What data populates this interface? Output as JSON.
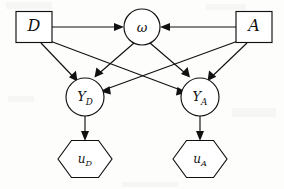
{
  "diagram": {
    "type": "influence-diagram",
    "background_color": "#fdfdfc",
    "line_color": "#111111",
    "node_fill_color": "#ffffff",
    "width": 284,
    "height": 189,
    "nodes": [
      {
        "id": "D",
        "label": "D",
        "shape": "square",
        "role": "decision",
        "cx": 34,
        "cy": 27,
        "w": 36,
        "h": 31
      },
      {
        "id": "A",
        "label": "A",
        "shape": "square",
        "role": "decision",
        "cx": 254,
        "cy": 27,
        "w": 36,
        "h": 31
      },
      {
        "id": "w",
        "label": "ω",
        "shape": "circle",
        "role": "chance",
        "cx": 142,
        "cy": 27,
        "r": 18
      },
      {
        "id": "YD",
        "label": "Y",
        "sub": "D",
        "shape": "circle",
        "role": "chance",
        "cx": 85,
        "cy": 97,
        "r": 19
      },
      {
        "id": "YA",
        "label": "Y",
        "sub": "A",
        "shape": "circle",
        "role": "chance",
        "cx": 200,
        "cy": 97,
        "r": 19
      },
      {
        "id": "uD",
        "label": "u",
        "sub": "D",
        "shape": "hexagon",
        "role": "utility",
        "cx": 85,
        "cy": 159,
        "w": 55,
        "h": 38
      },
      {
        "id": "uA",
        "label": "u",
        "sub": "A",
        "shape": "hexagon",
        "role": "utility",
        "cx": 200,
        "cy": 159,
        "w": 55,
        "h": 38
      }
    ],
    "edges": [
      {
        "from": "D",
        "to": "w",
        "style": "straight",
        "arrow": true
      },
      {
        "from": "A",
        "to": "w",
        "style": "straight",
        "arrow": true
      },
      {
        "from": "D",
        "to": "YD",
        "style": "straight",
        "arrow": true
      },
      {
        "from": "D",
        "to": "YA",
        "style": "straight",
        "arrow": true
      },
      {
        "from": "A",
        "to": "YA",
        "style": "straight",
        "arrow": true
      },
      {
        "from": "A",
        "to": "YD",
        "style": "straight",
        "arrow": true
      },
      {
        "from": "w",
        "to": "YD",
        "style": "straight",
        "arrow": true
      },
      {
        "from": "w",
        "to": "YA",
        "style": "straight",
        "arrow": true
      },
      {
        "from": "YD",
        "to": "uD",
        "style": "straight",
        "arrow": true
      },
      {
        "from": "YA",
        "to": "uA",
        "style": "straight",
        "arrow": true
      }
    ]
  }
}
